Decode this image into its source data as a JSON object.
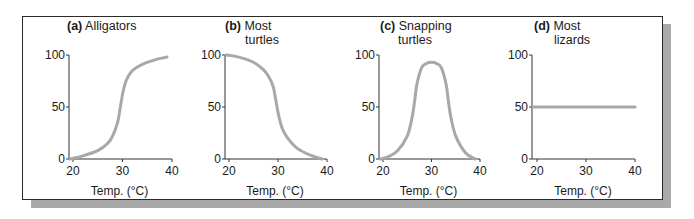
{
  "figure": {
    "frame_color": "#2a2a2a",
    "shadow_color": "#a9a9a9",
    "curve_color": "#a8a8a8"
  },
  "chart_data": [
    {
      "type": "line",
      "panel_label": "(a)",
      "title_lines": [
        "Alligators"
      ],
      "xlabel": "Temp. (°C)",
      "ylabel": "",
      "x_ticks": [
        "20",
        "30",
        "40"
      ],
      "y_ticks": [
        "0",
        "50",
        "100"
      ],
      "xlim": [
        20,
        40
      ],
      "ylim": [
        0,
        100
      ],
      "grid": false,
      "x": [
        19,
        22,
        25,
        27,
        28,
        29,
        29.5,
        30,
        30.5,
        31,
        32,
        34,
        37,
        39
      ],
      "values": [
        0,
        3,
        8,
        15,
        22,
        35,
        48,
        62,
        72,
        78,
        85,
        91,
        96,
        98
      ]
    },
    {
      "type": "line",
      "panel_label": "(b)",
      "title_lines": [
        "Most",
        "turtles"
      ],
      "xlabel": "Temp. (°C)",
      "ylabel": "",
      "x_ticks": [
        "20",
        "30",
        "40"
      ],
      "y_ticks": [
        "0",
        "50",
        "100"
      ],
      "xlim": [
        20,
        40
      ],
      "ylim": [
        0,
        100
      ],
      "grid": false,
      "x": [
        19,
        22,
        25,
        27,
        28,
        29,
        29.5,
        30,
        30.5,
        31,
        32,
        34,
        37,
        39
      ],
      "values": [
        100,
        98,
        93,
        86,
        80,
        70,
        58,
        45,
        35,
        28,
        20,
        10,
        3,
        0
      ]
    },
    {
      "type": "line",
      "panel_label": "(c)",
      "title_lines": [
        "Snapping",
        "turtles"
      ],
      "xlabel": "Temp. (°C)",
      "ylabel": "",
      "x_ticks": [
        "20",
        "30",
        "40"
      ],
      "y_ticks": [
        "0",
        "50",
        "100"
      ],
      "xlim": [
        20,
        40
      ],
      "ylim": [
        0,
        100
      ],
      "grid": false,
      "x": [
        19,
        21,
        23,
        25,
        26,
        26.5,
        27,
        28,
        29,
        30,
        31,
        32,
        33,
        33.5,
        34,
        35,
        37,
        39
      ],
      "values": [
        0,
        2,
        8,
        22,
        40,
        55,
        72,
        88,
        92,
        93,
        92,
        88,
        72,
        55,
        40,
        22,
        6,
        0
      ]
    },
    {
      "type": "line",
      "panel_label": "(d)",
      "title_lines": [
        "Most",
        "lizards"
      ],
      "xlabel": "Temp. (°C)",
      "ylabel": "",
      "x_ticks": [
        "20",
        "30",
        "40"
      ],
      "y_ticks": [
        "0",
        "50",
        "100"
      ],
      "xlim": [
        20,
        40
      ],
      "ylim": [
        0,
        100
      ],
      "grid": false,
      "x": [
        19,
        40
      ],
      "values": [
        50,
        50
      ]
    }
  ]
}
